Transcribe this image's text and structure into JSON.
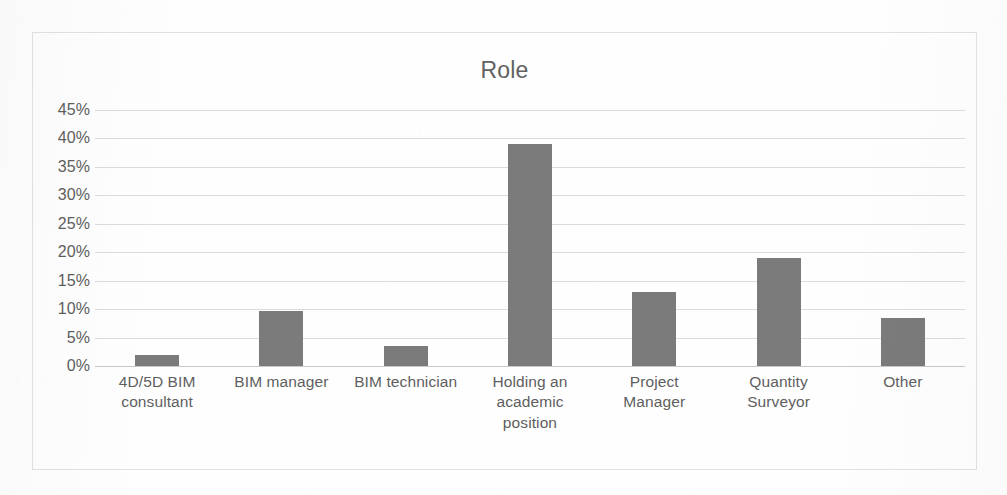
{
  "chart_data": {
    "type": "bar",
    "title": "Role",
    "xlabel": "",
    "ylabel": "",
    "categories": [
      "4D/5D BIM consultant",
      "BIM manager",
      "BIM technician",
      "Holding an academic position",
      "Project Manager",
      "Quantity Surveyor",
      "Other"
    ],
    "category_lines": [
      [
        "4D/5D BIM",
        "consultant"
      ],
      [
        "BIM manager"
      ],
      [
        "BIM technician"
      ],
      [
        "Holding an",
        "academic",
        "position"
      ],
      [
        "Project",
        "Manager"
      ],
      [
        "Quantity",
        "Surveyor"
      ],
      [
        "Other"
      ]
    ],
    "values": [
      2.0,
      9.7,
      3.5,
      39.0,
      13.0,
      19.0,
      8.5
    ],
    "value_labels": [
      "2%",
      "10%",
      "3%",
      "39%",
      "13%",
      "19%",
      "8%"
    ],
    "ylim": [
      0,
      45
    ],
    "ytick_values": [
      0,
      5,
      10,
      15,
      20,
      25,
      30,
      35,
      40,
      45
    ],
    "ytick_labels": [
      "0%",
      "5%",
      "10%",
      "15%",
      "20%",
      "25%",
      "30%",
      "35%",
      "40%",
      "45%"
    ],
    "grid": true,
    "legend": false,
    "legend_position": "none",
    "bar_color": "#7b7b7b",
    "gridline_color": "#dcdcdc",
    "axis_color": "#c9c9c9",
    "text_color": "#5e5e5e",
    "background_color": "#ffffff",
    "frame_border_color": "#e2e2e2"
  }
}
